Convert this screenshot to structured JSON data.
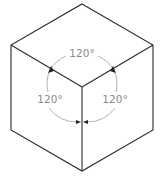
{
  "diagram": {
    "angle_labels": {
      "top": "120°",
      "left": "120°",
      "right": "120°"
    },
    "colors": {
      "edge": "#2a2a2a",
      "arc": "#a8a8a8",
      "label": "#8a8a8a",
      "arrow": "#222222"
    }
  }
}
